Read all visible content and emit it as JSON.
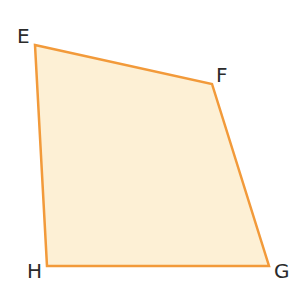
{
  "diagram": {
    "type": "quadrilateral",
    "fill_color": "#fdf0d5",
    "stroke_color": "#f29a3a",
    "vertices": [
      {
        "name": "E",
        "x": 35,
        "y": 45,
        "label_x": 17,
        "label_y": 43
      },
      {
        "name": "F",
        "x": 212,
        "y": 84,
        "label_x": 216,
        "label_y": 82
      },
      {
        "name": "G",
        "x": 269,
        "y": 266,
        "label_x": 274,
        "label_y": 278
      },
      {
        "name": "H",
        "x": 47,
        "y": 266,
        "label_x": 27,
        "label_y": 278
      }
    ],
    "labels": {
      "E": "E",
      "F": "F",
      "G": "G",
      "H": "H"
    }
  }
}
